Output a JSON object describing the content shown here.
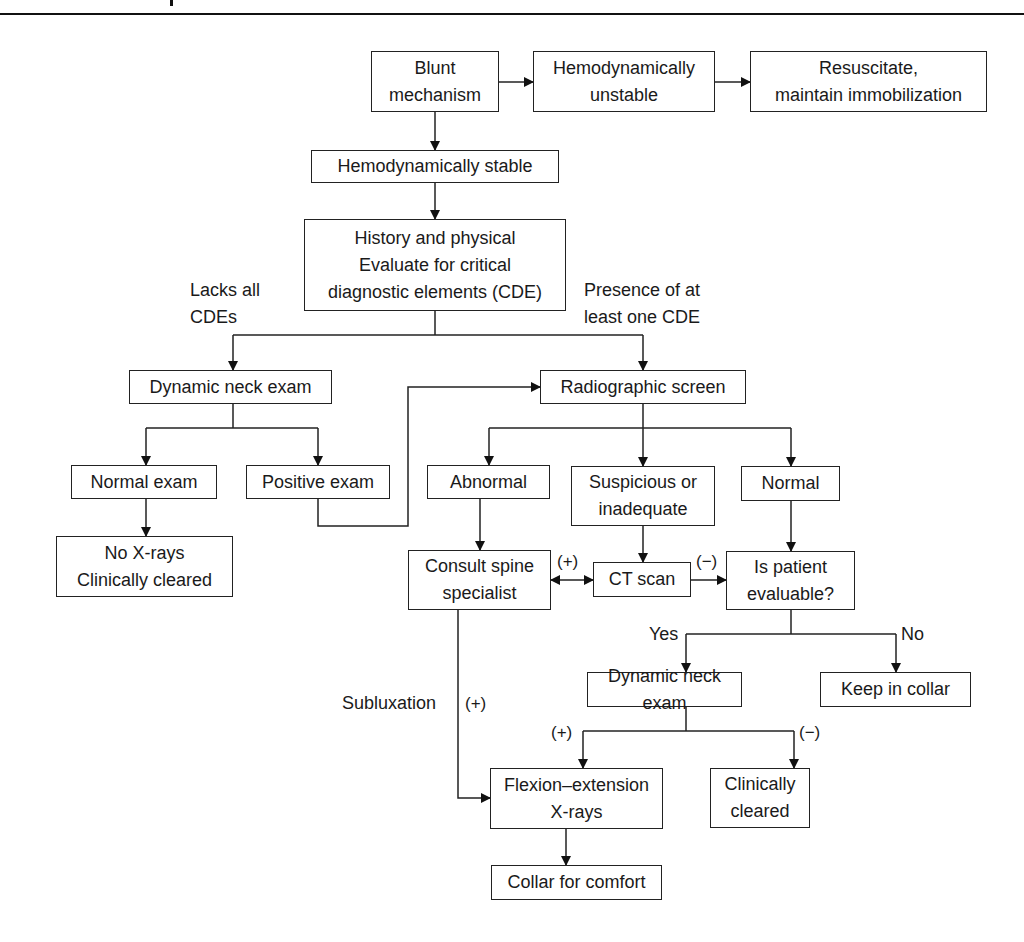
{
  "diagram": {
    "nodes": {
      "blunt": "Blunt\nmechanism",
      "unstable": "Hemodynamically\nunstable",
      "resuscitate": "Resuscitate,\nmaintain immobilization",
      "stable": "Hemodynamically stable",
      "history": "History and physical\nEvaluate for critical\ndiagnostic elements (CDE)",
      "dyn_neck_1": "Dynamic neck exam",
      "radiographic": "Radiographic screen",
      "normal_exam": "Normal exam",
      "positive_exam": "Positive exam",
      "abnormal": "Abnormal",
      "suspicious": "Suspicious or\ninadequate",
      "normal": "Normal",
      "no_xrays": "No X-rays\nClinically cleared",
      "consult": "Consult spine\nspecialist",
      "ct": "CT scan",
      "evaluable": "Is patient\nevaluable?",
      "dyn_neck_2": "Dynamic neck exam",
      "keep_collar": "Keep in collar",
      "flexion": "Flexion–extension\nX-rays",
      "clinically_cleared": "Clinically\ncleared",
      "collar_comfort": "Collar for comfort"
    },
    "labels": {
      "lacks_cde": "Lacks all\nCDEs",
      "presence_cde": "Presence of at\nleast one CDE",
      "ct_pos": "(+)",
      "ct_neg": "(−)",
      "yes": "Yes",
      "no": "No",
      "subluxation": "Subluxation",
      "sublux_pos": "(+)",
      "dyn_pos": "(+)",
      "dyn_neg": "(−)"
    }
  }
}
